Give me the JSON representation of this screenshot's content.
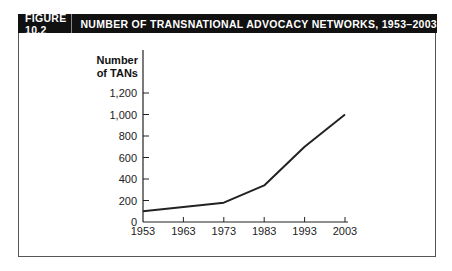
{
  "figure": {
    "number": "FIGURE 10.2",
    "title": "NUMBER OF TRANSNATIONAL ADVOCACY NETWORKS, 1953–2003"
  },
  "chart_data": {
    "type": "line",
    "title": "NUMBER OF TRANSNATIONAL ADVOCACY NETWORKS, 1953–2003",
    "xlabel": "",
    "ylabel": "Number of TANs",
    "ylabel_lines": [
      "Number",
      "of TANs"
    ],
    "categories": [
      "1953",
      "1963",
      "1973",
      "1983",
      "1993",
      "2003"
    ],
    "x": [
      1953,
      1963,
      1973,
      1983,
      1993,
      2003
    ],
    "series": [
      {
        "name": "Number of TANs",
        "values": [
          100,
          140,
          180,
          340,
          700,
          1000
        ]
      }
    ],
    "yticks": [
      0,
      200,
      400,
      600,
      800,
      1000,
      1200
    ],
    "ytick_labels": [
      "0",
      "200",
      "400",
      "600",
      "800",
      "1,000",
      "1,200"
    ],
    "ylim": [
      0,
      1200
    ],
    "xlim": [
      1953,
      2003
    ],
    "grid": false,
    "legend": false
  }
}
